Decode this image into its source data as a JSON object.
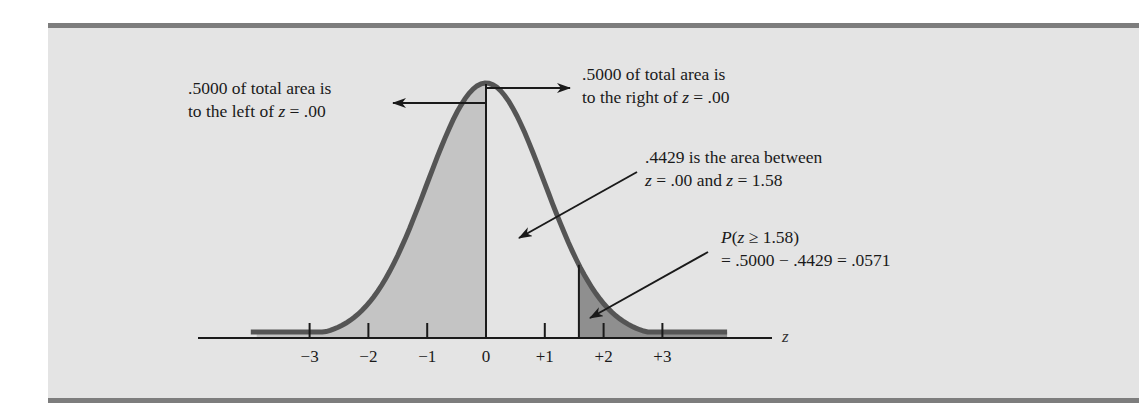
{
  "figure": {
    "annotations": {
      "left_half_line1": ".5000 of total area is",
      "left_half_line2_pre": "to the left of ",
      "left_half_line2_var": "z",
      "left_half_line2_post": " = .00",
      "right_half_line1": ".5000 of total area is",
      "right_half_line2_pre": "to the right of ",
      "right_half_line2_var": "z",
      "right_half_line2_post": " = .00",
      "between_line1": ".4429 is the area between",
      "between_line2_var1": "z",
      "between_line2_mid": " = .00 and ",
      "between_line2_var2": "z",
      "between_line2_post": " = 1.58",
      "tail_line1_P": "P",
      "tail_line1_open": "(",
      "tail_line1_var": "z",
      "tail_line1_post": " ≥ 1.58)",
      "tail_line2": "= .5000 − .4429 = .0571"
    },
    "axis_label": "z",
    "tick_labels": [
      "−3",
      "−2",
      "−1",
      "0",
      "+1",
      "+2",
      "+3"
    ],
    "colors": {
      "background": "#e4e4e4",
      "rule": "#7d7d7d",
      "curve": "#555555",
      "left_shade": "#c4c4c4",
      "tail_shade": "#8f8f8f",
      "ink": "#1a1a1a"
    }
  },
  "chart_data": {
    "type": "area",
    "xlabel": "z",
    "ylabel": "",
    "x_ticks": [
      -3,
      -2,
      -1,
      0,
      1,
      2,
      3
    ],
    "x_tick_labels": [
      "−3",
      "−2",
      "−1",
      "0",
      "+1",
      "+2",
      "+3"
    ],
    "distribution": {
      "name": "standard normal",
      "mean": 0,
      "sd": 1
    },
    "shaded_regions": [
      {
        "from": "-inf",
        "to": 0.0,
        "area": 0.5,
        "shade": "light",
        "label": ".5000 of total area is to the left of z = .00"
      },
      {
        "from": 1.58,
        "to": "inf",
        "area": 0.0571,
        "shade": "dark",
        "label": "P(z ≥ 1.58) = .5000 − .4429 = .0571"
      }
    ],
    "unshaded_regions": [
      {
        "from": 0.0,
        "to": 1.58,
        "area": 0.4429,
        "label": ".4429 is the area between z = .00 and z = 1.58"
      }
    ],
    "right_half": {
      "from": 0.0,
      "to": "inf",
      "area": 0.5,
      "label": ".5000 of total area is to the right of z = .00"
    },
    "vertical_lines": [
      0.0,
      1.58
    ],
    "grid": false,
    "legend": "none"
  }
}
